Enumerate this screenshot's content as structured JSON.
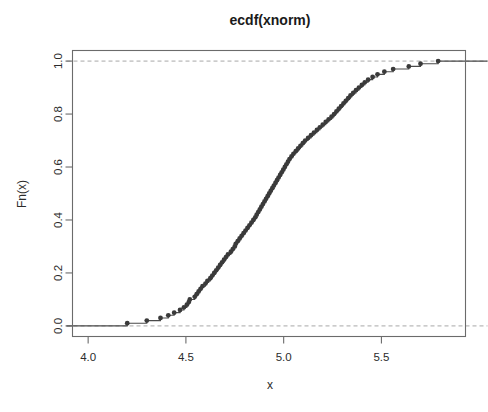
{
  "chart_data": {
    "type": "line",
    "title": "ecdf(xnorm)",
    "xlabel": "x",
    "ylabel": "Fn(x)",
    "xlim": [
      3.92,
      5.93
    ],
    "ylim": [
      -0.04,
      1.04
    ],
    "grid": false,
    "legend": null,
    "xticks": [
      "4.0",
      "4.5",
      "5.0",
      "5.5"
    ],
    "xtick_values": [
      4.0,
      4.5,
      5.0,
      5.5
    ],
    "yticks": [
      "0.0",
      "0.2",
      "0.4",
      "0.6",
      "0.8",
      "1.0"
    ],
    "ytick_values": [
      0.0,
      0.2,
      0.4,
      0.6,
      0.8,
      1.0
    ],
    "reference_lines": [
      {
        "y": 0.0,
        "style": "dashed",
        "color": "#a8a8a8"
      },
      {
        "y": 1.0,
        "style": "dashed",
        "color": "#a8a8a8"
      }
    ],
    "series": [
      {
        "name": "ecdf(xnorm)",
        "marker": "filled-circle",
        "color": "#3a3a3a",
        "n": 100,
        "x": [
          4.2,
          4.3,
          4.37,
          4.41,
          4.44,
          4.47,
          4.49,
          4.505,
          4.515,
          4.52,
          4.545,
          4.555,
          4.565,
          4.575,
          4.585,
          4.6,
          4.61,
          4.625,
          4.635,
          4.645,
          4.655,
          4.665,
          4.675,
          4.685,
          4.695,
          4.705,
          4.715,
          4.73,
          4.74,
          4.75,
          4.755,
          4.765,
          4.775,
          4.785,
          4.795,
          4.805,
          4.815,
          4.825,
          4.835,
          4.845,
          4.855,
          4.862,
          4.87,
          4.878,
          4.886,
          4.894,
          4.902,
          4.91,
          4.918,
          4.926,
          4.934,
          4.942,
          4.95,
          4.958,
          4.966,
          4.974,
          4.982,
          4.99,
          4.998,
          5.006,
          5.014,
          5.022,
          5.03,
          5.04,
          5.05,
          5.062,
          5.074,
          5.086,
          5.098,
          5.11,
          5.125,
          5.14,
          5.155,
          5.17,
          5.185,
          5.2,
          5.215,
          5.23,
          5.245,
          5.258,
          5.27,
          5.282,
          5.294,
          5.306,
          5.318,
          5.33,
          5.342,
          5.356,
          5.37,
          5.385,
          5.4,
          5.415,
          5.432,
          5.455,
          5.48,
          5.515,
          5.56,
          5.64,
          5.7,
          5.79
        ],
        "y": [
          0.01,
          0.02,
          0.03,
          0.04,
          0.05,
          0.06,
          0.07,
          0.08,
          0.09,
          0.1,
          0.11,
          0.12,
          0.13,
          0.14,
          0.15,
          0.16,
          0.17,
          0.18,
          0.19,
          0.2,
          0.21,
          0.22,
          0.23,
          0.24,
          0.25,
          0.26,
          0.27,
          0.28,
          0.29,
          0.3,
          0.31,
          0.32,
          0.33,
          0.34,
          0.35,
          0.36,
          0.37,
          0.38,
          0.39,
          0.4,
          0.41,
          0.42,
          0.43,
          0.44,
          0.45,
          0.46,
          0.47,
          0.48,
          0.49,
          0.5,
          0.51,
          0.52,
          0.53,
          0.54,
          0.55,
          0.56,
          0.57,
          0.58,
          0.59,
          0.6,
          0.61,
          0.62,
          0.63,
          0.64,
          0.65,
          0.66,
          0.67,
          0.68,
          0.69,
          0.7,
          0.71,
          0.72,
          0.73,
          0.74,
          0.75,
          0.76,
          0.77,
          0.78,
          0.79,
          0.8,
          0.81,
          0.82,
          0.83,
          0.84,
          0.85,
          0.86,
          0.87,
          0.88,
          0.89,
          0.9,
          0.91,
          0.92,
          0.93,
          0.94,
          0.95,
          0.96,
          0.97,
          0.98,
          0.99,
          1.0
        ]
      }
    ]
  },
  "plot": {
    "title": "ecdf(xnorm)",
    "xlabel": "x",
    "ylabel": "Fn(x)"
  }
}
